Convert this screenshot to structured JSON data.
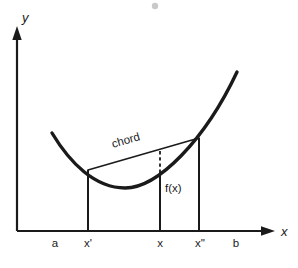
{
  "figure": {
    "background_color": "#ffffff",
    "ink_color": "#1a1a1a",
    "width": 298,
    "height": 268
  },
  "axes": {
    "y_label": "y",
    "x_label": "x",
    "y_axis_x": 17,
    "x_axis_y": 231,
    "x_axis_end": 272,
    "y_axis_top": 28
  },
  "tick_labels": [
    {
      "text": "a",
      "x": 55,
      "y": 243
    },
    {
      "text": "x'",
      "x": 88,
      "y": 243
    },
    {
      "text": "x",
      "x": 160,
      "y": 243
    },
    {
      "text": "x''",
      "x": 200,
      "y": 243
    },
    {
      "text": "b",
      "x": 236,
      "y": 243
    }
  ],
  "annotations": {
    "chord_label": "chord",
    "chord_label_x": 113,
    "chord_label_y": 148,
    "chord_label_rotation": -16.5,
    "function_label": "f(x)",
    "function_label_x": 165,
    "function_label_y": 192
  },
  "chart_data": {
    "type": "line",
    "xlabel": "x",
    "ylabel": "y",
    "grid": false,
    "legend": null,
    "series": [
      {
        "name": "f(x)",
        "role": "convex-curve",
        "path": "M 52 133 C 70 163, 95 188, 125 188 C 158 188, 205 140, 237 72",
        "stroke_width": 3.4,
        "points": [
          {
            "x": 52,
            "y": 133
          },
          {
            "x": 88,
            "y": 170
          },
          {
            "x": 125,
            "y": 188
          },
          {
            "x": 160,
            "y": 175
          },
          {
            "x": 199,
            "y": 138
          },
          {
            "x": 237,
            "y": 72
          }
        ]
      },
      {
        "name": "chord",
        "role": "secant-line",
        "stroke_width": 1.6,
        "points": [
          {
            "x": 88,
            "y": 170
          },
          {
            "x": 199,
            "y": 138
          }
        ]
      }
    ],
    "drop_lines": [
      {
        "name": "x-prime-drop",
        "x": 88,
        "y_top": 170,
        "y_bottom": 231
      },
      {
        "name": "x-drop",
        "x": 160,
        "y_top": 175,
        "y_bottom": 231
      },
      {
        "name": "x-double-prime-drop",
        "x": 199,
        "y_top": 138,
        "y_bottom": 231
      }
    ],
    "dashed_segments": [
      {
        "name": "f-of-x-gap",
        "x": 160,
        "y_top": 152,
        "y_bottom": 175
      }
    ]
  },
  "artifacts": {
    "speck_x": 155,
    "speck_y": 6,
    "speck_r": 3.2,
    "speck_color": "#c9c9c9"
  }
}
